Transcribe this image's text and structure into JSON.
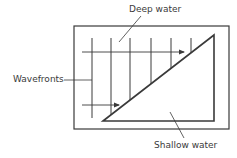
{
  "diagram": {
    "labels": {
      "deep_water": "Deep water",
      "wavefronts": "Wavefronts",
      "shallow_water": "Shallow water"
    },
    "colors": {
      "stroke": "#3a3a3a",
      "background": "#ffffff"
    },
    "frame": {
      "x": 74,
      "y": 26,
      "width": 155,
      "height": 103
    },
    "shallow_region": {
      "shape": "triangle",
      "points": [
        [
          103,
          121
        ],
        [
          214,
          35
        ],
        [
          214,
          121
        ]
      ]
    },
    "wavefronts_x": [
      92,
      111,
      130,
      151,
      171,
      191
    ],
    "wave_direction_arrows": [
      {
        "x1": 82,
        "y1": 52,
        "x2": 184,
        "y2": 52
      },
      {
        "x1": 82,
        "y1": 105,
        "x2": 119,
        "y2": 105
      }
    ]
  }
}
